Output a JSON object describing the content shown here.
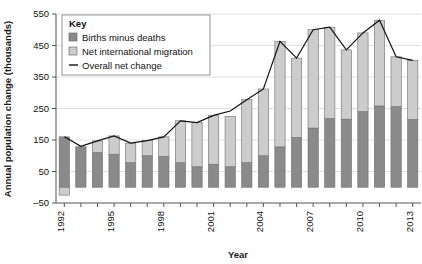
{
  "chart_data": {
    "type": "bar",
    "title": "",
    "subtitle": "",
    "xlabel": "Year",
    "ylabel": "Annual population change (thousands)",
    "ylim": [
      -50,
      550
    ],
    "yticks": [
      -50,
      50,
      150,
      250,
      350,
      450,
      550
    ],
    "ytick_labels": [
      "–50",
      "50",
      "150",
      "250",
      "350",
      "450",
      "550"
    ],
    "xlim_categories_count": 22,
    "grid": true,
    "grid_axis": "y",
    "stacked": true,
    "legend_position": "top-left-inset",
    "legend_title": "Key",
    "categories": [
      1992,
      1993,
      1994,
      1995,
      1996,
      1997,
      1998,
      1999,
      2000,
      2001,
      2002,
      2003,
      2004,
      2005,
      2006,
      2007,
      2008,
      2009,
      2010,
      2011,
      2012,
      2013
    ],
    "xtick_labels": [
      "1992",
      "1995",
      "1998",
      "2001",
      "2004",
      "2007",
      "2010",
      "2013"
    ],
    "xtick_category_indices": [
      0,
      3,
      6,
      9,
      12,
      15,
      18,
      21
    ],
    "series": [
      {
        "name": "Births minus deaths",
        "color": "#8a8a8a",
        "type": "bar-segment",
        "values": [
          160,
          128,
          110,
          105,
          78,
          100,
          98,
          78,
          65,
          73,
          65,
          78,
          100,
          128,
          158,
          188,
          218,
          216,
          240,
          258,
          256,
          215
        ]
      },
      {
        "name": "Net international migration",
        "color": "#cccccc",
        "type": "bar-segment",
        "values": [
          -25,
          0,
          37,
          58,
          62,
          48,
          62,
          133,
          140,
          155,
          160,
          200,
          212,
          335,
          252,
          312,
          290,
          220,
          250,
          272,
          158,
          188
        ]
      }
    ],
    "line_series": {
      "name": "Overall net change",
      "color": "#111111",
      "values": [
        160,
        130,
        147,
        163,
        140,
        148,
        160,
        211,
        205,
        228,
        242,
        278,
        312,
        463,
        410,
        500,
        508,
        436,
        490,
        530,
        414,
        403
      ]
    }
  },
  "legend": {
    "title": "Key",
    "items": [
      {
        "label": "Births minus deaths",
        "swatch": "#8a8a8a",
        "kind": "swatch"
      },
      {
        "label": "Net international migration",
        "swatch": "#cccccc",
        "kind": "swatch"
      },
      {
        "label": "Overall net change",
        "swatch": "#111111",
        "kind": "line"
      }
    ]
  },
  "axes": {
    "y_title": "Annual population change (thousands)",
    "x_title": "Year"
  },
  "colors": {
    "births_minus_deaths": "#8a8a8a",
    "net_migration": "#cccccc",
    "net_change_line": "#111111",
    "gridline": "#d9d9d9",
    "axis": "#555555",
    "background": "#ffffff"
  }
}
